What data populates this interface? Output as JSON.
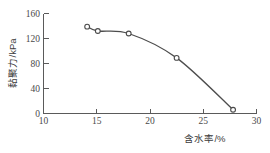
{
  "chart_data": {
    "type": "line",
    "title": "",
    "xlabel": "含水率/%",
    "ylabel": "黏聚力/kPa",
    "xlim": [
      10,
      30
    ],
    "ylim": [
      0,
      160
    ],
    "xticks": [
      10,
      15,
      20,
      25,
      30
    ],
    "yticks": [
      0,
      40,
      80,
      120,
      160
    ],
    "grid": false,
    "legend": false,
    "marker": "open-circle",
    "line_color": "#4d4d4d",
    "marker_face_color": "#ffffff",
    "marker_edge_color": "#4a4a4a",
    "series": [
      {
        "name": "黏聚力",
        "x": [
          14.1,
          15.1,
          18.0,
          22.5,
          27.8
        ],
        "values": [
          139,
          132,
          128,
          89,
          6
        ]
      }
    ]
  },
  "axes": {
    "y_title": "黏聚力/kPa",
    "x_title": "含水率/%",
    "y_tick_labels": [
      "0",
      "40",
      "80",
      "120",
      "160"
    ],
    "x_tick_labels": [
      "10",
      "15",
      "20",
      "25",
      "30"
    ]
  }
}
